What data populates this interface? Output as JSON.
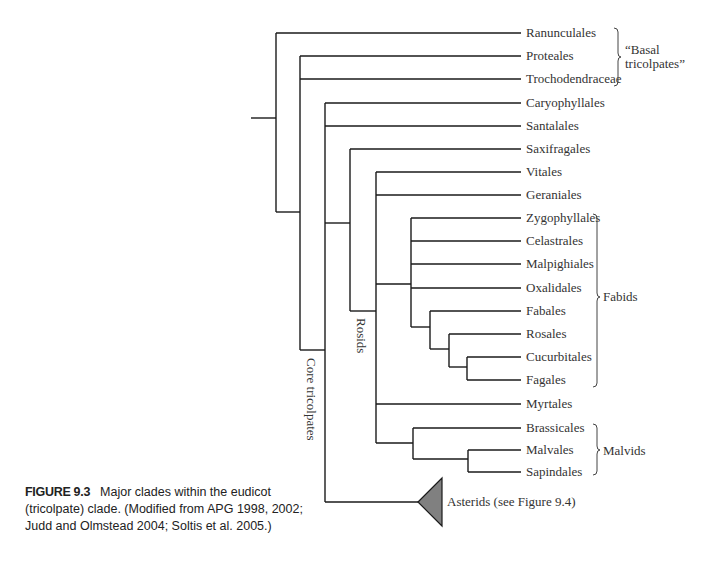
{
  "figure": {
    "label": "FIGURE 9.3",
    "caption": "Major clades within the eudicot (tricolpate) clade. (Modified from APG 1998, 2002; Judd and Olmstead 2004; Soltis et al. 2005.)"
  },
  "taxa": [
    {
      "name": "Ranunculales",
      "y": 33
    },
    {
      "name": "Proteales",
      "y": 56
    },
    {
      "name": "Trochodendraceae",
      "y": 79
    },
    {
      "name": "Caryophyllales",
      "y": 103
    },
    {
      "name": "Santalales",
      "y": 126
    },
    {
      "name": "Saxifragales",
      "y": 149
    },
    {
      "name": "Vitales",
      "y": 172
    },
    {
      "name": "Geraniales",
      "y": 195
    },
    {
      "name": "Zygophyllales",
      "y": 218
    },
    {
      "name": "Celastrales",
      "y": 241
    },
    {
      "name": "Malpighiales",
      "y": 264
    },
    {
      "name": "Oxalidales",
      "y": 288
    },
    {
      "name": "Fabales",
      "y": 311
    },
    {
      "name": "Rosales",
      "y": 334
    },
    {
      "name": "Cucurbitales",
      "y": 357
    },
    {
      "name": "Fagales",
      "y": 380
    },
    {
      "name": "Myrtales",
      "y": 404
    },
    {
      "name": "Brassicales",
      "y": 428
    },
    {
      "name": "Malvales",
      "y": 450
    },
    {
      "name": "Sapindales",
      "y": 472
    }
  ],
  "collapsed": {
    "name": "Asterids (see Figure 9.4)",
    "fill": "#808080"
  },
  "clade_labels": {
    "core": "Core tricolpates",
    "rosids": "Rosids",
    "basal_line1": "“Basal",
    "basal_line2": "tricolpates”",
    "fabids": "Fabids",
    "malvids": "Malvids"
  }
}
